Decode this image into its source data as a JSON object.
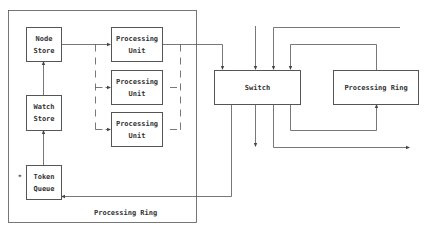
{
  "diagram": {
    "outer_ring": {
      "label": "Processing Ring"
    },
    "node_store": {
      "line1": "Node",
      "line2": "Store"
    },
    "watch_store": {
      "line1": "Watch",
      "line2": "Store"
    },
    "token_queue": {
      "line1": "Token",
      "line2": "Queue"
    },
    "processing_units": [
      {
        "line1": "Processing",
        "line2": "Unit"
      },
      {
        "line1": "Processing",
        "line2": "Unit"
      },
      {
        "line1": "Processing",
        "line2": "Unit"
      }
    ],
    "switch": {
      "label": "Switch"
    },
    "right_ring": {
      "label": "Processing Ring"
    },
    "marker": "*",
    "colors": {
      "line": "#555555",
      "text": "#333333",
      "background": "#ffffff"
    }
  }
}
